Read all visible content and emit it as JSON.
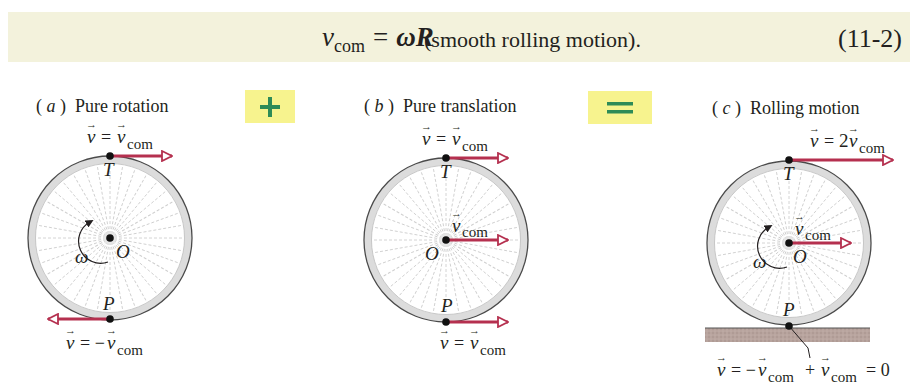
{
  "equation": {
    "lhs_symbol": "v",
    "lhs_subscript": "com",
    "operator": "=",
    "rhs": "ωR",
    "note": "(smooth rolling motion).",
    "number": "(11-2)",
    "band_color": "#f3f2dc"
  },
  "operators": {
    "plus": "+",
    "equals": "=",
    "box_color": "#f7f38e",
    "glyph_color": "#2e8b57"
  },
  "colors": {
    "arrow": "#b5304f",
    "rim": "#4a4a4a",
    "spokes": "#c8c8c8",
    "ground": "#b8a49e"
  },
  "panels": [
    {
      "id": "a",
      "letter": "a",
      "title": "Pure rotation",
      "top_point": "T",
      "center_point": "O",
      "bottom_point": "P",
      "angular_symbol": "ω",
      "top_velocity": {
        "lhs": "v",
        "rel": "=",
        "coef": "",
        "rhs": "v",
        "sub": "com"
      },
      "center_velocity": null,
      "bottom_velocity": {
        "lhs": "v",
        "rel": "= −",
        "coef": "",
        "rhs": "v",
        "sub": "com"
      }
    },
    {
      "id": "b",
      "letter": "b",
      "title": "Pure translation",
      "top_point": "T",
      "center_point": "O",
      "bottom_point": "P",
      "angular_symbol": null,
      "top_velocity": {
        "lhs": "v",
        "rel": "=",
        "coef": "",
        "rhs": "v",
        "sub": "com"
      },
      "center_velocity": {
        "symbol": "v",
        "sub": "com"
      },
      "bottom_velocity": {
        "lhs": "v",
        "rel": "=",
        "coef": "",
        "rhs": "v",
        "sub": "com"
      }
    },
    {
      "id": "c",
      "letter": "c",
      "title": "Rolling motion",
      "top_point": "T",
      "center_point": "O",
      "bottom_point": "P",
      "angular_symbol": "ω",
      "top_velocity": {
        "lhs": "v",
        "rel": "=",
        "coef": "2",
        "rhs": "v",
        "sub": "com"
      },
      "center_velocity": {
        "symbol": "v",
        "sub": "com"
      },
      "bottom_equation": {
        "lhs": "v",
        "eq1": "= −",
        "t1": "v",
        "sub1": "com",
        "plus": "+",
        "t2": "v",
        "sub2": "com",
        "eq2": "= 0"
      }
    }
  ]
}
